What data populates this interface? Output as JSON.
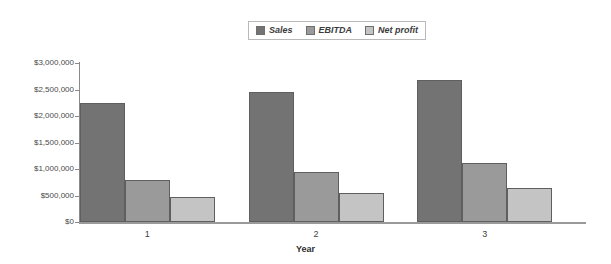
{
  "chart_data": {
    "type": "bar",
    "title": "",
    "xlabel": "Year",
    "ylabel": "",
    "categories": [
      "1",
      "2",
      "3"
    ],
    "series": [
      {
        "name": "Sales",
        "color": "#737373",
        "values": [
          2240000,
          2450000,
          2680000
        ]
      },
      {
        "name": "EBITDA",
        "color": "#9a9a9a",
        "values": [
          800000,
          950000,
          1110000
        ]
      },
      {
        "name": "Net profit",
        "color": "#c4c4c4",
        "values": [
          470000,
          550000,
          640000
        ]
      }
    ],
    "ylim": [
      0,
      3000000
    ],
    "ytick_values": [
      0,
      500000,
      1000000,
      1500000,
      2000000,
      2500000,
      3000000
    ],
    "ytick_labels": [
      "$0",
      "$500,000",
      "$1,000,000",
      "$1,500,000",
      "$2,000,000",
      "$2,500,000",
      "$3,000,000"
    ],
    "grid": false,
    "legend_position": "top-center"
  },
  "legend": {
    "items": [
      {
        "label": "Sales"
      },
      {
        "label": "EBITDA"
      },
      {
        "label": "Net profit"
      }
    ]
  },
  "axis": {
    "x_title": "Year"
  }
}
